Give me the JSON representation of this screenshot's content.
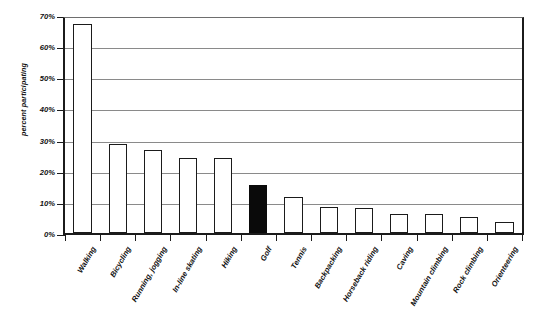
{
  "chart_data": {
    "type": "bar",
    "title": "",
    "xlabel": "",
    "ylabel": "percent participating",
    "ylim": [
      0,
      70
    ],
    "ytick_labels": [
      "0%",
      "10%",
      "20%",
      "30%",
      "40%",
      "50%",
      "60%",
      "70%"
    ],
    "ytick_values": [
      0,
      10,
      20,
      30,
      40,
      50,
      60,
      70
    ],
    "grid": true,
    "legend": "none",
    "categories": [
      "Walking",
      "Bicycling",
      "Running, jogging",
      "In-line skating",
      "Hiking",
      "Golf",
      "Tennis",
      "Backpacking",
      "Horseback riding",
      "Caving",
      "Mountain climbing",
      "Rock climbing",
      "Orienteering"
    ],
    "values": [
      67,
      28.5,
      26.5,
      24,
      24,
      15.5,
      11.5,
      8.5,
      8,
      6,
      6,
      5,
      3.5
    ],
    "highlighted_category": "Golf",
    "bar_fill_default": "#ffffff",
    "bar_fill_highlight": "#0a0a0a",
    "bar_stroke": "#1b1b1b",
    "gridline_color": "#8a8a8a",
    "axis_color": "#1b1b1b",
    "background": "#ffffff"
  }
}
